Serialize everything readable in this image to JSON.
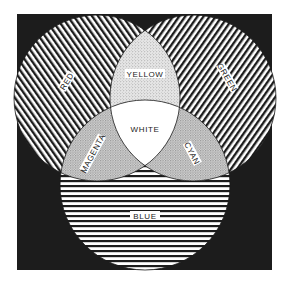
{
  "diagram": {
    "background_color": "#1c1c1c",
    "circles": [
      {
        "id": "red",
        "label": "RED",
        "pattern": "diagonal-stripes-forward"
      },
      {
        "id": "green",
        "label": "GREEN",
        "pattern": "diagonal-stripes-backward"
      },
      {
        "id": "blue",
        "label": "BLUE",
        "pattern": "horizontal-stripes"
      }
    ],
    "intersections": [
      {
        "id": "yellow",
        "label": "YELLOW",
        "sets": [
          "red",
          "green"
        ],
        "pattern": "light-stipple"
      },
      {
        "id": "magenta",
        "label": "MAGENTA",
        "sets": [
          "red",
          "blue"
        ],
        "pattern": "dense-stipple"
      },
      {
        "id": "cyan",
        "label": "CYAN",
        "sets": [
          "green",
          "blue"
        ],
        "pattern": "dense-stipple"
      },
      {
        "id": "white",
        "label": "WHITE",
        "sets": [
          "red",
          "green",
          "blue"
        ],
        "pattern": "solid-white"
      }
    ]
  }
}
